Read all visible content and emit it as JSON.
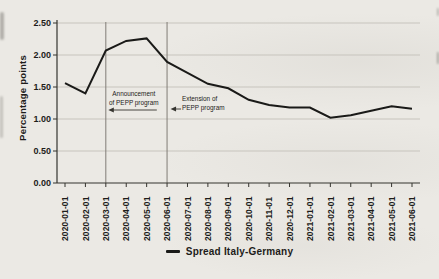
{
  "chart_data": {
    "type": "line",
    "title": "",
    "xlabel": "",
    "ylabel": "Percentage points",
    "ylim": [
      0,
      2.5
    ],
    "y_ticks": [
      0,
      0.5,
      1.0,
      1.5,
      2.0,
      2.5
    ],
    "y_tick_labels": [
      "0.00",
      "0.50",
      "1.00",
      "1.50",
      "2.00",
      "2.50"
    ],
    "grid": "horizontal",
    "legend_position": "bottom-center",
    "categories": [
      "2020-01-01",
      "2020-02-01",
      "2020-03-01",
      "2020-04-01",
      "2020-05-01",
      "2020-06-01",
      "2020-07-01",
      "2020-08-01",
      "2020-09-01",
      "2020-10-01",
      "2020-11-01",
      "2020-12-01",
      "2021-01-01",
      "2021-02-01",
      "2021-03-01",
      "2021-04-01",
      "2021-05-01",
      "2021-06-01"
    ],
    "series": [
      {
        "name": "Spread Italy-Germany",
        "values": [
          1.56,
          1.4,
          2.07,
          2.22,
          2.26,
          1.89,
          1.72,
          1.55,
          1.48,
          1.3,
          1.22,
          1.18,
          1.18,
          1.02,
          1.06,
          1.13,
          1.2,
          1.16
        ]
      }
    ],
    "reference_lines": [
      {
        "at": "2020-03-01"
      },
      {
        "at": "2020-06-01"
      }
    ],
    "annotations": [
      {
        "text_lines": [
          "Announcement",
          "of PEPP program"
        ],
        "anchor": "2020-03-01",
        "arrow_direction": "left",
        "align": "center"
      },
      {
        "text_lines": [
          "Extension of",
          "PEPP program"
        ],
        "anchor": "2020-06-01",
        "arrow_direction": "left",
        "align": "left"
      }
    ]
  },
  "legend": {
    "label": "Spread Italy-Germany"
  },
  "colors": {
    "background": "#ebe9e4",
    "line": "#1a1a18",
    "axis": "#35342f",
    "grid": "#c7c4bd",
    "refline": "#807d76",
    "text": "#1d1c1a"
  }
}
